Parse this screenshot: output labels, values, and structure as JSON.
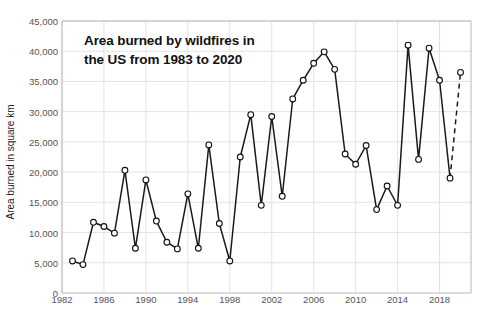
{
  "chart_data": {
    "type": "line",
    "title": "Area burned by wildfires in\nthe US from 1983 to 2020",
    "xlabel": "",
    "ylabel": "Area burned in square km",
    "xlim": [
      1982,
      2021
    ],
    "ylim": [
      0,
      45000
    ],
    "grid": true,
    "legend": "none",
    "marker": "open-circle",
    "x_ticks": [
      1982,
      1986,
      1990,
      1994,
      1998,
      2002,
      2006,
      2010,
      2014,
      2018
    ],
    "y_ticks": [
      "0",
      "5,000",
      "10,000",
      "15,000",
      "20,000",
      "25,000",
      "30,000",
      "35,000",
      "40,000",
      "45,000"
    ],
    "y_tick_values": [
      0,
      5000,
      10000,
      15000,
      20000,
      25000,
      30000,
      35000,
      40000,
      45000
    ],
    "series": [
      {
        "name": "Area burned by wildfires in the US",
        "x": [
          1983,
          1984,
          1985,
          1986,
          1987,
          1988,
          1989,
          1990,
          1991,
          1992,
          1993,
          1994,
          1995,
          1996,
          1997,
          1998,
          1999,
          2000,
          2001,
          2002,
          2003,
          2004,
          2005,
          2006,
          2007,
          2008,
          2009,
          2010,
          2011,
          2012,
          2013,
          2014,
          2015,
          2016,
          2017,
          2018,
          2019
        ],
        "values": [
          5300,
          4700,
          11700,
          11000,
          9900,
          20300,
          7400,
          18700,
          11900,
          8400,
          7300,
          16400,
          7400,
          24500,
          11500,
          5300,
          22500,
          29500,
          14500,
          29200,
          16000,
          32100,
          35200,
          38000,
          39900,
          37000,
          23000,
          21300,
          24400,
          13800,
          17700,
          14500,
          41000,
          22100,
          40500,
          35200,
          19000
        ]
      },
      {
        "name": "2020 projection (dashed)",
        "style": "dashed",
        "x": [
          2019,
          2020
        ],
        "values": [
          19000,
          36500
        ]
      }
    ]
  },
  "axis": {
    "y_title": "Area burned in square km"
  },
  "colors": {
    "line": "#1a1a1a",
    "marker_fill": "#ffffff",
    "marker_stroke": "#111111",
    "grid": "#e2e2e2",
    "axis": "#b8b8b8",
    "tick_text": "#555555",
    "title_text": "#111111",
    "background": "#ffffff"
  }
}
